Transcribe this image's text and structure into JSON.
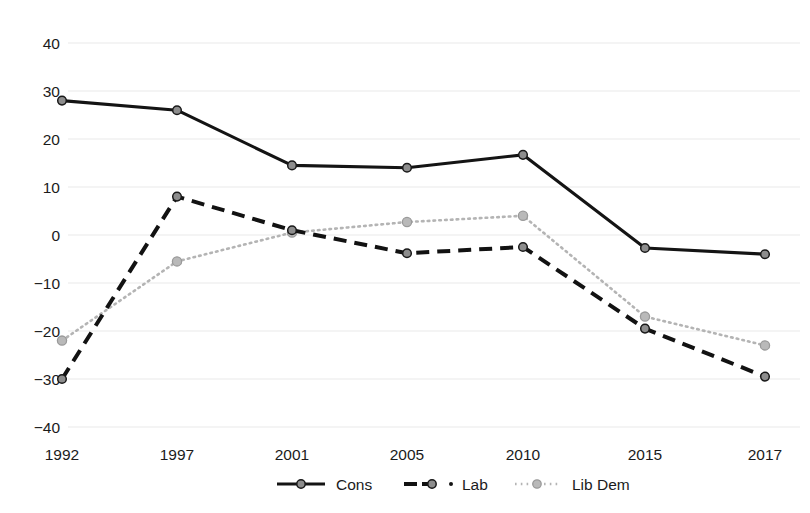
{
  "chart_data": {
    "type": "line",
    "title": "",
    "subtitle": "",
    "xlabel": "",
    "ylabel": "",
    "categories": [
      "1992",
      "1997",
      "2001",
      "2005",
      "2010",
      "2015",
      "2017"
    ],
    "x": [
      1992,
      1997,
      2001,
      2005,
      2010,
      2015,
      2017
    ],
    "xtick_labels": [
      "1992",
      "1997",
      "2001",
      "2005",
      "2010",
      "2015",
      "2017"
    ],
    "ytick_labels": [
      "40",
      "30",
      "20",
      "10",
      "0",
      "−10",
      "−20",
      "−30",
      "−40"
    ],
    "yticks": [
      40,
      30,
      20,
      10,
      0,
      -10,
      -20,
      -30,
      -40
    ],
    "ylim": [
      -40,
      40
    ],
    "grid": "horizontal",
    "legend_position": "bottom-center",
    "series": [
      {
        "name": "Cons",
        "style": "solid",
        "color": "#141414",
        "marker": "circle",
        "values": [
          28,
          26,
          14.5,
          14,
          16.7,
          -2.7,
          -4
        ]
      },
      {
        "name": "Lab",
        "style": "dashed",
        "color": "#121212",
        "marker": "circle",
        "values": [
          -30,
          8,
          1,
          -3.8,
          -2.5,
          -19.5,
          -29.5
        ]
      },
      {
        "name": "Lib Dem",
        "style": "dotted",
        "color": "#b4b4b4",
        "marker": "circle",
        "values": [
          -22,
          -5.5,
          0.5,
          2.7,
          4,
          -17,
          -23
        ]
      }
    ]
  },
  "legend": {
    "entries": [
      {
        "label": "Cons",
        "style": "solid"
      },
      {
        "label": "Lab",
        "style": "dashed"
      },
      {
        "label": "Lib Dem",
        "style": "dotted"
      }
    ]
  },
  "axes": {
    "y_labels": [
      "40",
      "30",
      "20",
      "10",
      "0",
      "−10",
      "−20",
      "−30",
      "−40"
    ],
    "x_labels": [
      "1992",
      "1997",
      "2001",
      "2005",
      "2010",
      "2015",
      "2017"
    ]
  }
}
